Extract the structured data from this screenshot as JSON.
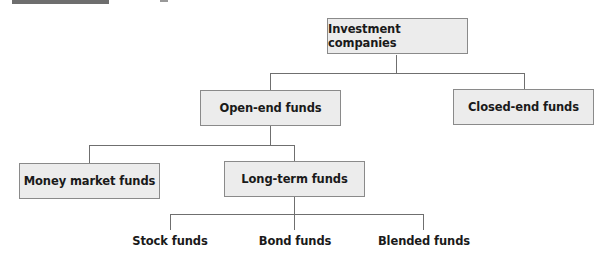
{
  "header": {
    "label_bar_color": "#6e6e6e"
  },
  "diagram": {
    "type": "hierarchy",
    "root": {
      "label": "Investment companies",
      "children": [
        {
          "label": "Open-end funds",
          "children": [
            {
              "label": "Money market funds"
            },
            {
              "label": "Long-term funds",
              "children": [
                {
                  "label": "Stock funds"
                },
                {
                  "label": "Bond funds"
                },
                {
                  "label": "Blended funds"
                }
              ]
            }
          ]
        },
        {
          "label": "Closed-end funds"
        }
      ]
    }
  },
  "nodes": {
    "investment_companies": "Investment companies",
    "open_end": "Open-end funds",
    "closed_end": "Closed-end funds",
    "money_market": "Money market funds",
    "long_term": "Long-term funds",
    "stock": "Stock funds",
    "bond": "Bond funds",
    "blended": "Blended funds"
  },
  "colors": {
    "box_fill": "#ececec",
    "box_border": "#8a8a8a",
    "connector": "#6f6f6f",
    "text": "#1a1a1a"
  }
}
